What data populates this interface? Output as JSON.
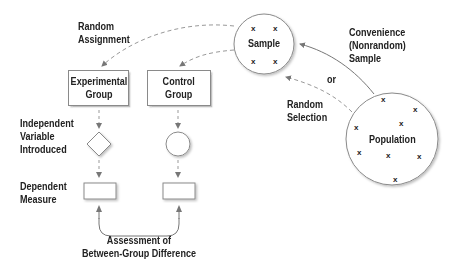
{
  "diagram": {
    "nodes": {
      "sample": {
        "label": "Sample",
        "marker": "x"
      },
      "population": {
        "label": "Population",
        "marker": "x"
      },
      "experimental_group": {
        "label": "Experimental\nGroup"
      },
      "control_group": {
        "label": "Control\nGroup"
      }
    },
    "edge_labels": {
      "random_assignment_1": "Random",
      "random_assignment_2": "Assignment",
      "convenience_1": "Convenience",
      "convenience_2": "(Nonrandom)",
      "convenience_3": "Sample",
      "or": "or",
      "random_selection_1": "Random",
      "random_selection_2": "Selection",
      "assessment_1": "Assessment of",
      "assessment_2": "Between-Group Difference"
    },
    "row_labels": {
      "independent_1": "Independent",
      "independent_2": "Variable",
      "independent_3": "Introduced",
      "dependent_1": "Dependent",
      "dependent_2": "Measure"
    },
    "colors": {
      "line": "#8a8a8a",
      "text": "#222222"
    }
  }
}
